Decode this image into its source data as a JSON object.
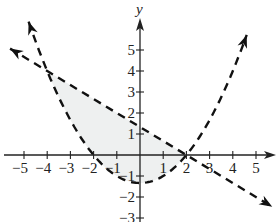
{
  "chart_data": {
    "type": "line",
    "title": "",
    "xlabel": "",
    "ylabel": "y",
    "xlim": [
      -5.9,
      6.0
    ],
    "ylim": [
      -3.2,
      6.3
    ],
    "x_ticks": [
      -5,
      -4,
      -3,
      -2,
      -1,
      1,
      2,
      3,
      4,
      5
    ],
    "x_tick_labels": [
      "−5",
      "−4",
      "−3",
      "−2",
      "−1",
      "1",
      "2",
      "3",
      "4",
      "5"
    ],
    "y_ticks": [
      5,
      4,
      3,
      2,
      1,
      -1,
      -2,
      -3
    ],
    "y_tick_labels": [
      "5",
      "4",
      "3",
      "2",
      "1",
      "−1",
      "−2",
      "−3"
    ],
    "grid": false,
    "series": [
      {
        "name": "parabola",
        "equation": "y = (x^2 - 4) / 3",
        "style": "dashed",
        "arrows": "both",
        "x_range": [
          -4.8,
          4.6
        ]
      },
      {
        "name": "line",
        "equation": "y = -2/3 x + 4/3",
        "style": "dashed",
        "arrows": "both",
        "x_range": [
          -5.6,
          5.7
        ]
      }
    ],
    "shaded_region": {
      "description": "region above parabola and below line",
      "x_range": [
        -4,
        2
      ],
      "fill": "#eef0f0"
    },
    "intersections": [
      [
        -4,
        4
      ],
      [
        2,
        0
      ]
    ],
    "colors": {
      "curves": "#111111",
      "axes": "#222222",
      "fill": "#eef0f0"
    }
  }
}
